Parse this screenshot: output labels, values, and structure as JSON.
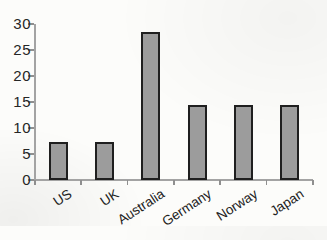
{
  "chart_data": {
    "type": "bar",
    "categories": [
      "US",
      "UK",
      "Australia",
      "Germany",
      "Norway",
      "Japan"
    ],
    "values": [
      7.3,
      7.3,
      28.5,
      14.5,
      14.5,
      14.5
    ],
    "title": "",
    "xlabel": "",
    "ylabel": "",
    "ylim": [
      0,
      30
    ],
    "yticks": [
      0,
      5,
      10,
      15,
      20,
      25,
      30
    ],
    "grid": false,
    "legend": "none",
    "colors": {
      "bar_fill": "#9c9c9c",
      "bar_border": "#1f1f1f",
      "axis": "#a3a3a3",
      "text": "#262626",
      "background": "#fcfcfa"
    }
  }
}
